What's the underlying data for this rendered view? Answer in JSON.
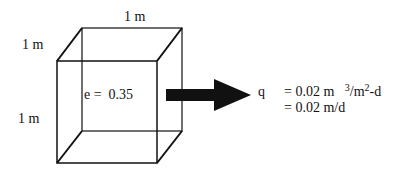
{
  "diagram": {
    "cube": {
      "top_edge_label": "1 m",
      "depth_edge_label": "1 m",
      "height_edge_label": "1 m",
      "porosity_label": "e =  0.35"
    },
    "flux": {
      "symbol": "q",
      "line1_prefix": "= 0.02 m",
      "line1_exp": "3",
      "line1_mid": "/m",
      "line1_exp2": "2",
      "line1_suffix": "-d",
      "line2": "= 0.02 m/d"
    },
    "colors": {
      "lines": "#111111",
      "arrow": "#111111",
      "background": "#ffffff"
    }
  }
}
